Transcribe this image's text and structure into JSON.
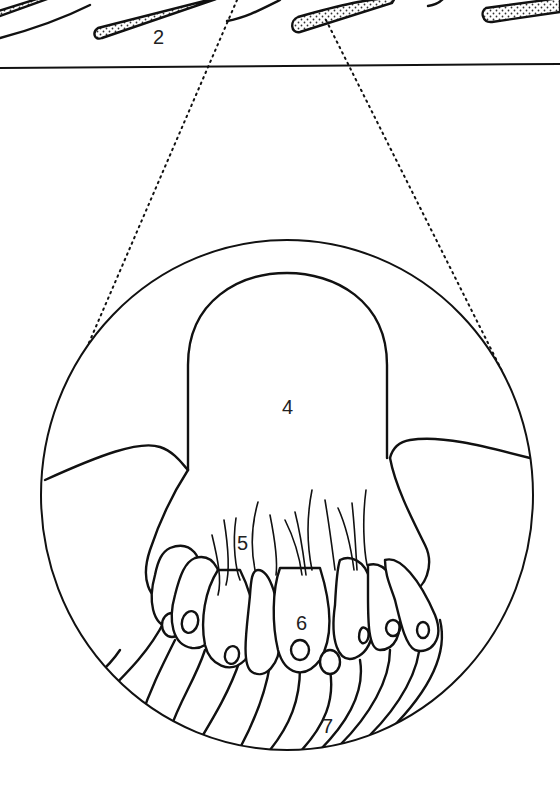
{
  "figure": {
    "type": "anatomical line drawing",
    "colors": {
      "stroke": "#111111",
      "background": "#ffffff"
    }
  },
  "labels": {
    "scale": "2",
    "cupula": "4",
    "hair_bundles": "5",
    "hair_cell": "6",
    "nerve_fibres": "7"
  }
}
